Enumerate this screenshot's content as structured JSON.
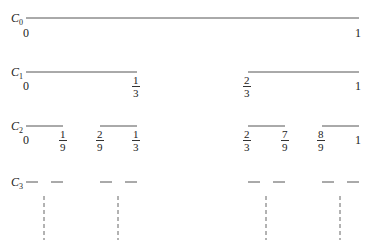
{
  "levels": [
    {
      "name": "C",
      "index": "0"
    },
    {
      "name": "C",
      "index": "1"
    },
    {
      "name": "C",
      "index": "2"
    },
    {
      "name": "C",
      "index": "3"
    }
  ],
  "labels": {
    "c0_left": "0",
    "c0_right": "1",
    "c1_left": "0",
    "c1_one_third": {
      "num": "1",
      "den": "3"
    },
    "c1_two_thirds": {
      "num": "2",
      "den": "3"
    },
    "c1_right": "1",
    "c2_left": "0",
    "c2_one_ninth": {
      "num": "1",
      "den": "9"
    },
    "c2_two_ninths": {
      "num": "2",
      "den": "9"
    },
    "c2_one_third": {
      "num": "1",
      "den": "3"
    },
    "c2_two_thirds": {
      "num": "2",
      "den": "3"
    },
    "c2_seven_ninths": {
      "num": "7",
      "den": "9"
    },
    "c2_eight_ninths": {
      "num": "8",
      "den": "9"
    },
    "c2_right": "1"
  },
  "colors": {
    "line": "#555555",
    "text": "#222222"
  }
}
